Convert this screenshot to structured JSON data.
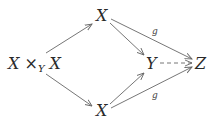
{
  "diagram": {
    "type": "commutative-diagram",
    "nodes": {
      "pullback": {
        "base": "X ×",
        "sub": "Y",
        "tail": " X"
      },
      "top": "X",
      "bottom": "X",
      "middle": "Y",
      "right": "Z"
    },
    "edges": [
      {
        "from": "pullback",
        "to": "top",
        "label": "",
        "style": "solid"
      },
      {
        "from": "pullback",
        "to": "bottom",
        "label": "",
        "style": "solid"
      },
      {
        "from": "top",
        "to": "middle",
        "label": "",
        "style": "solid"
      },
      {
        "from": "bottom",
        "to": "middle",
        "label": "",
        "style": "solid"
      },
      {
        "from": "top",
        "to": "right",
        "label": "g",
        "style": "solid"
      },
      {
        "from": "bottom",
        "to": "right",
        "label": "g",
        "style": "solid"
      },
      {
        "from": "middle",
        "to": "right",
        "label": "",
        "style": "dashed"
      }
    ],
    "labels": {
      "top_g": "g",
      "bottom_g": "g"
    }
  }
}
